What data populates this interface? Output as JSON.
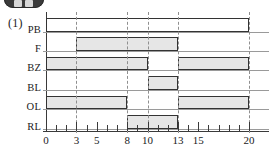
{
  "badge": {
    "name": "app-badge-cropped",
    "color": "#3b3b3b"
  },
  "figure": {
    "index_label": "(1)",
    "type": "timing-diagram"
  },
  "chart_data": {
    "type": "timing",
    "title": "",
    "xlabel": "",
    "ylabel": "",
    "xlim": [
      0,
      20
    ],
    "grid": false,
    "minor_tick_step": 1,
    "tick_values": [
      0,
      1,
      2,
      3,
      4,
      5,
      6,
      7,
      8,
      9,
      10,
      11,
      12,
      13,
      14,
      15,
      16,
      17,
      18,
      19,
      20
    ],
    "labeled_ticks": [
      {
        "value": 0,
        "label": "0"
      },
      {
        "value": 3,
        "label": "3"
      },
      {
        "value": 5,
        "label": "5"
      },
      {
        "value": 8,
        "label": "8"
      },
      {
        "value": 10,
        "label": "10"
      },
      {
        "value": 13,
        "label": "13"
      },
      {
        "value": 15,
        "label": "15"
      },
      {
        "value": 20,
        "label": "20"
      }
    ],
    "guide_lines": [
      3,
      8,
      10,
      13,
      20
    ],
    "signals": [
      {
        "name": "PB",
        "label": "PB",
        "fill": "#ffffff",
        "high_intervals": [
          [
            0,
            20
          ]
        ]
      },
      {
        "name": "F",
        "label": "F",
        "fill": "#e6e6e6",
        "high_intervals": [
          [
            3,
            13
          ]
        ]
      },
      {
        "name": "BZ",
        "label": "BZ",
        "fill": "#e6e6e6",
        "high_intervals": [
          [
            0,
            10
          ],
          [
            13,
            20
          ]
        ]
      },
      {
        "name": "BL",
        "label": "BL",
        "fill": "#e6e6e6",
        "high_intervals": [
          [
            10,
            13
          ]
        ]
      },
      {
        "name": "OL",
        "label": "OL",
        "fill": "#e6e6e6",
        "high_intervals": [
          [
            0,
            8
          ],
          [
            13,
            20
          ]
        ]
      },
      {
        "name": "RL",
        "label": "RL",
        "fill": "#e6e6e6",
        "high_intervals": [
          [
            8,
            13
          ]
        ]
      }
    ],
    "colors": {
      "stroke": "#333333",
      "fill": "#e6e6e6",
      "axis": "#3a3a3a",
      "baseline": "#9a9a9a",
      "guide": "#8f8f8f"
    }
  }
}
